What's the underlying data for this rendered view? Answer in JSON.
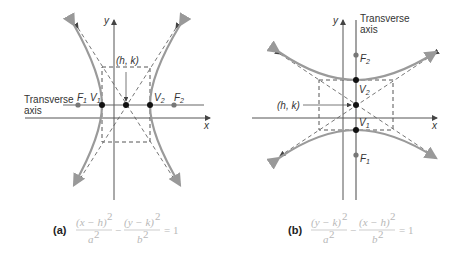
{
  "figure_a": {
    "caption_label": "(a)",
    "equation": {
      "term1_num": "(x − h)",
      "term1_den": "a",
      "term2_num": "(y − k)",
      "term2_den": "b",
      "exp": "2",
      "minus": "−",
      "rhs": "= 1"
    },
    "labels": {
      "y_axis": "y",
      "x_axis": "x",
      "center": "(h, k)",
      "transverse_line1": "Transverse",
      "transverse_line2": "axis",
      "F1": "F",
      "F1_sub": "1",
      "F2": "F",
      "F2_sub": "2",
      "V1": "V",
      "V1_sub": "1",
      "V2": "V",
      "V2_sub": "2"
    }
  },
  "figure_b": {
    "caption_label": "(b)",
    "equation": {
      "term1_num": "(y − k)",
      "term1_den": "a",
      "term2_num": "(x − h)",
      "term2_den": "b",
      "exp": "2",
      "minus": "−",
      "rhs": "= 1"
    },
    "labels": {
      "y_axis": "y",
      "x_axis": "x",
      "center": "(h, k)",
      "transverse_line1": "Transverse",
      "transverse_line2": "axis",
      "F1": "F",
      "F1_sub": "1",
      "F2": "F",
      "F2_sub": "2",
      "V1": "V",
      "V1_sub": "1",
      "V2": "V",
      "V2_sub": "2"
    }
  },
  "colors": {
    "curve": "#9a9a9a",
    "axis": "#555555",
    "dashed": "#666666",
    "vertex": "#111111",
    "focus": "#777777",
    "equation": "#b8b8b8"
  }
}
